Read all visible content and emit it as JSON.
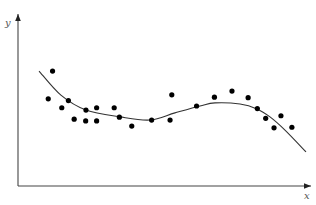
{
  "chart_data": {
    "type": "scatter",
    "title": "",
    "xlabel": "x",
    "ylabel": "y",
    "xlim": [
      0,
      10
    ],
    "ylim": [
      0,
      6
    ],
    "grid": false,
    "legend": null,
    "ticks": {
      "x": [],
      "y": []
    },
    "series": [
      {
        "name": "observations",
        "kind": "scatter",
        "points": [
          [
            1.2,
            4.01
          ],
          [
            1.05,
            3.04
          ],
          [
            1.52,
            2.73
          ],
          [
            1.75,
            2.98
          ],
          [
            2.36,
            2.65
          ],
          [
            2.73,
            2.73
          ],
          [
            3.34,
            2.73
          ],
          [
            1.95,
            2.33
          ],
          [
            2.35,
            2.27
          ],
          [
            2.73,
            2.27
          ],
          [
            3.52,
            2.4
          ],
          [
            3.95,
            2.09
          ],
          [
            4.64,
            2.3
          ],
          [
            5.28,
            2.3
          ],
          [
            5.34,
            3.18
          ],
          [
            6.2,
            2.79
          ],
          [
            6.82,
            3.1
          ],
          [
            7.43,
            3.31
          ],
          [
            7.99,
            3.08
          ],
          [
            8.31,
            2.7
          ],
          [
            8.6,
            2.36
          ],
          [
            9.13,
            2.45
          ],
          [
            8.89,
            2.03
          ],
          [
            9.51,
            2.05
          ]
        ]
      },
      {
        "name": "fitted curve",
        "kind": "line",
        "points": [
          [
            0.73,
            4.01
          ],
          [
            1.49,
            3.17
          ],
          [
            2.36,
            2.65
          ],
          [
            3.54,
            2.41
          ],
          [
            4.58,
            2.3
          ],
          [
            5.45,
            2.55
          ],
          [
            6.32,
            2.79
          ],
          [
            6.84,
            2.9
          ],
          [
            7.71,
            2.86
          ],
          [
            8.3,
            2.69
          ],
          [
            8.75,
            2.41
          ],
          [
            9.27,
            1.95
          ],
          [
            10.0,
            1.19
          ]
        ]
      }
    ]
  }
}
